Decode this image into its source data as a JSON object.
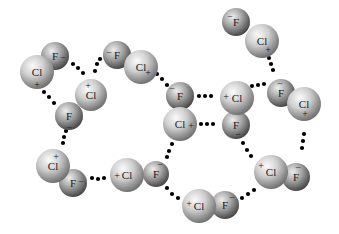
{
  "figure": {
    "atom_labels": {
      "chlorine": "Cl",
      "fluorine": "F"
    },
    "charges": {
      "positive": "+",
      "negative": "−"
    },
    "colors": {
      "background": "#ffffff",
      "cl_light": "#f4f4f4",
      "cl_dark": "#7a7a7a",
      "f_light": "#e6e6e6",
      "f_dark": "#4a4a4a",
      "interaction_dot": "#000000"
    }
  },
  "molecules": [
    {
      "id": "m1",
      "cl": {
        "x": 37,
        "y": 72,
        "r": 17,
        "label": "Cl",
        "charge": "+",
        "qx": 37,
        "qy": 85
      },
      "f": {
        "x": 55,
        "y": 56,
        "r": 14,
        "label": "F",
        "charge": "−",
        "qx": 63,
        "qy": 58
      }
    },
    {
      "id": "m2",
      "cl": {
        "x": 91,
        "y": 95,
        "r": 16,
        "label": "Cl",
        "charge": "+",
        "qx": 88,
        "qy": 86
      },
      "f": {
        "x": 69,
        "y": 116,
        "r": 14,
        "label": "F",
        "charge": "−",
        "qx": 69,
        "qy": 128
      }
    },
    {
      "id": "m3",
      "cl": {
        "x": 141,
        "y": 67,
        "r": 17,
        "label": "Cl",
        "charge": "+",
        "qx": 148,
        "qy": 73
      },
      "f": {
        "x": 117,
        "y": 55,
        "r": 14,
        "label": "F",
        "charge": "−",
        "qx": 109,
        "qy": 53
      }
    },
    {
      "id": "m4",
      "cl": {
        "x": 262,
        "y": 41,
        "r": 17,
        "label": "Cl",
        "charge": "+",
        "qx": 268,
        "qy": 50
      },
      "f": {
        "x": 236,
        "y": 22,
        "r": 14,
        "label": "F",
        "charge": "−",
        "qx": 230,
        "qy": 17
      }
    },
    {
      "id": "m5",
      "cl": {
        "x": 180,
        "y": 124,
        "r": 17,
        "label": "Cl",
        "charge": "+",
        "qx": 191,
        "qy": 126
      },
      "f": {
        "x": 180,
        "y": 96,
        "r": 14,
        "label": "F",
        "charge": "−",
        "qx": 172,
        "qy": 89
      }
    },
    {
      "id": "m6",
      "cl": {
        "x": 237,
        "y": 98,
        "r": 17,
        "label": "Cl",
        "charge": "+",
        "qx": 226,
        "qy": 97
      },
      "f": {
        "x": 236,
        "y": 125,
        "r": 14,
        "label": "F",
        "charge": "−",
        "qx": 238,
        "qy": 135
      }
    },
    {
      "id": "m7",
      "cl": {
        "x": 304,
        "y": 104,
        "r": 17,
        "label": "Cl",
        "charge": "+",
        "qx": 305,
        "qy": 114
      },
      "f": {
        "x": 281,
        "y": 93,
        "r": 14,
        "label": "F",
        "charge": "−",
        "qx": 280,
        "qy": 84
      }
    },
    {
      "id": "m8",
      "cl": {
        "x": 53,
        "y": 166,
        "r": 17,
        "label": "Cl",
        "charge": "+",
        "qx": 56,
        "qy": 157
      },
      "f": {
        "x": 73,
        "y": 183,
        "r": 14,
        "label": "F",
        "charge": "−",
        "qx": 81,
        "qy": 182
      }
    },
    {
      "id": "m9",
      "cl": {
        "x": 127,
        "y": 175,
        "r": 17,
        "label": "Cl",
        "charge": "+",
        "qx": 117,
        "qy": 176
      },
      "f": {
        "x": 156,
        "y": 174,
        "r": 13,
        "label": "F",
        "charge": "−",
        "qx": 160,
        "qy": 165
      }
    },
    {
      "id": "m10",
      "cl": {
        "x": 199,
        "y": 206,
        "r": 17,
        "label": "Cl",
        "charge": "+",
        "qx": 189,
        "qy": 204
      },
      "f": {
        "x": 225,
        "y": 205,
        "r": 14,
        "label": "F",
        "charge": "−",
        "qx": 232,
        "qy": 198
      }
    },
    {
      "id": "m11",
      "cl": {
        "x": 271,
        "y": 172,
        "r": 17,
        "label": "Cl",
        "charge": "+",
        "qx": 261,
        "qy": 166
      },
      "f": {
        "x": 296,
        "y": 177,
        "r": 14,
        "label": "F",
        "charge": "−",
        "qx": 298,
        "qy": 168
      }
    }
  ],
  "interactions": [
    {
      "id": "i1",
      "dots": [
        [
          73,
          64
        ],
        [
          78,
          68
        ],
        [
          83,
          73
        ]
      ]
    },
    {
      "id": "i2",
      "dots": [
        [
          100,
          59
        ],
        [
          97,
          64
        ],
        [
          95,
          71
        ]
      ]
    },
    {
      "id": "i3",
      "dots": [
        [
          44,
          92
        ],
        [
          49,
          97
        ],
        [
          54,
          103
        ]
      ]
    },
    {
      "id": "i4",
      "dots": [
        [
          66,
          131
        ],
        [
          64,
          137
        ],
        [
          63,
          143
        ]
      ]
    },
    {
      "id": "i5",
      "dots": [
        [
          157,
          74
        ],
        [
          162,
          79
        ],
        [
          167,
          85
        ]
      ]
    },
    {
      "id": "i6",
      "dots": [
        [
          199,
          96
        ],
        [
          205,
          96
        ],
        [
          211,
          96
        ]
      ]
    },
    {
      "id": "i7",
      "dots": [
        [
          201,
          124
        ],
        [
          207,
          124
        ],
        [
          213,
          124
        ]
      ]
    },
    {
      "id": "i8",
      "dots": [
        [
          269,
          58
        ],
        [
          271,
          64
        ],
        [
          273,
          70
        ]
      ]
    },
    {
      "id": "i9",
      "dots": [
        [
          252,
          86
        ],
        [
          258,
          85
        ],
        [
          264,
          84
        ]
      ]
    },
    {
      "id": "i10",
      "dots": [
        [
          304,
          134
        ],
        [
          303,
          141
        ],
        [
          302,
          148
        ]
      ]
    },
    {
      "id": "i11",
      "dots": [
        [
          92,
          178
        ],
        [
          98,
          179
        ],
        [
          104,
          178
        ]
      ]
    },
    {
      "id": "i12",
      "dots": [
        [
          172,
          144
        ],
        [
          169,
          151
        ],
        [
          167,
          157
        ]
      ]
    },
    {
      "id": "i13",
      "dots": [
        [
          167,
          188
        ],
        [
          172,
          194
        ],
        [
          178,
          198
        ]
      ]
    },
    {
      "id": "i14",
      "dots": [
        [
          243,
          143
        ],
        [
          247,
          150
        ],
        [
          251,
          156
        ]
      ]
    },
    {
      "id": "i15",
      "dots": [
        [
          242,
          198
        ],
        [
          248,
          194
        ],
        [
          254,
          190
        ]
      ]
    }
  ]
}
